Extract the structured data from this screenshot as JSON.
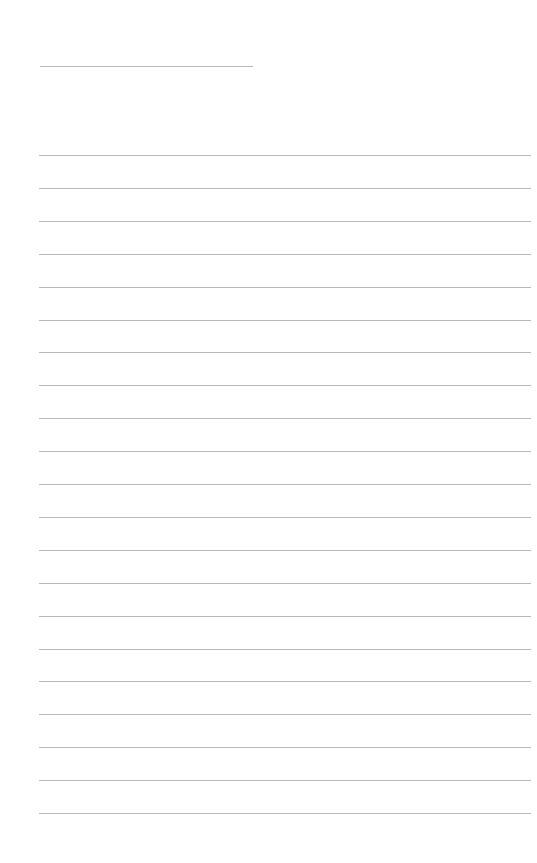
{
  "page": {
    "type": "blank-lined-paper",
    "background_color": "#ffffff",
    "line_color": "#b8b8b8",
    "title_line": {
      "x": 40,
      "y": 66,
      "width": 213
    },
    "ruled_lines": {
      "count": 21,
      "start_y": 155,
      "spacing": 32.9,
      "x": 39,
      "width": 492
    }
  }
}
